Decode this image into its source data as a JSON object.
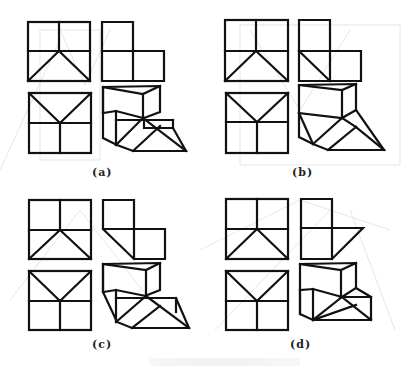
{
  "figure": {
    "panels": [
      {
        "id": "a",
        "label": "(a)",
        "label_pos": [
          92,
          168
        ]
      },
      {
        "id": "b",
        "label": "(b)",
        "label_pos": [
          292,
          168
        ]
      },
      {
        "id": "c",
        "label": "(c)",
        "label_pos": [
          92,
          340
        ]
      },
      {
        "id": "d",
        "label": "(d)",
        "label_pos": [
          290,
          340
        ]
      }
    ],
    "view_names": [
      "front-view",
      "side-view",
      "top-view",
      "isometric-view"
    ],
    "colors": {
      "ink": "#111111",
      "ghost_lines": "#e6e6e6",
      "background": "#ffffff"
    }
  }
}
